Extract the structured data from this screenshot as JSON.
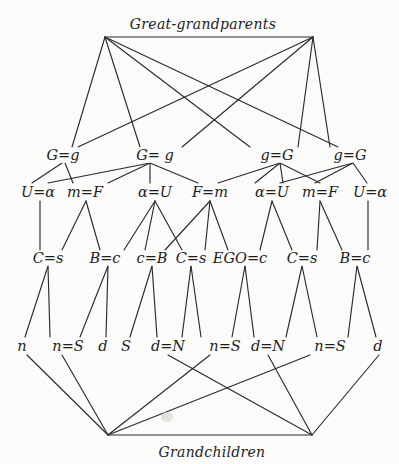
{
  "diagram": {
    "title_top": "Great-grandparents",
    "title_bottom": "Grandchildren",
    "colors": {
      "background": "#fbfbf9",
      "ink": "#2b2b2b"
    },
    "apexes": {
      "top_left": [
        105,
        37
      ],
      "top_right": [
        313,
        37
      ],
      "bottom_left": [
        108,
        435
      ],
      "bottom_right": [
        312,
        435
      ]
    },
    "rows": {
      "grandparents": [
        {
          "id": "gp1",
          "label": "G=g",
          "x": 63,
          "y": 155
        },
        {
          "id": "gp2",
          "label": "G= g",
          "x": 155,
          "y": 155
        },
        {
          "id": "gp3",
          "label": "g=G",
          "x": 277,
          "y": 155
        },
        {
          "id": "gp4",
          "label": "g=G",
          "x": 350,
          "y": 155
        }
      ],
      "parents": [
        {
          "id": "p1",
          "label": "U=α",
          "x": 38,
          "y": 192
        },
        {
          "id": "p2",
          "label": "m=F",
          "x": 85,
          "y": 192
        },
        {
          "id": "p3",
          "label": "α=U",
          "x": 155,
          "y": 192
        },
        {
          "id": "p4",
          "label": "F=m",
          "x": 210,
          "y": 192
        },
        {
          "id": "p5",
          "label": "α=U",
          "x": 272,
          "y": 192
        },
        {
          "id": "p6",
          "label": "m=F",
          "x": 320,
          "y": 192
        },
        {
          "id": "p7",
          "label": "U=α",
          "x": 370,
          "y": 192
        }
      ],
      "ego_generation": [
        {
          "id": "e1",
          "label": "C=s",
          "x": 48,
          "y": 258
        },
        {
          "id": "e2",
          "label": "B=c",
          "x": 105,
          "y": 258
        },
        {
          "id": "e3",
          "label": "c=B",
          "x": 152,
          "y": 258
        },
        {
          "id": "e4",
          "label": "C=s",
          "x": 191,
          "y": 258
        },
        {
          "id": "e5",
          "label": "EGO=c",
          "x": 240,
          "y": 258
        },
        {
          "id": "e6",
          "label": "C=s",
          "x": 302,
          "y": 258
        },
        {
          "id": "e7",
          "label": "B=c",
          "x": 355,
          "y": 258
        }
      ],
      "children": [
        {
          "id": "c1",
          "label": "n",
          "x": 22,
          "y": 346
        },
        {
          "id": "c2",
          "label": "n=S",
          "x": 68,
          "y": 346
        },
        {
          "id": "c3",
          "label": "d",
          "x": 103,
          "y": 346
        },
        {
          "id": "c4",
          "label": "S",
          "x": 126,
          "y": 346
        },
        {
          "id": "c5",
          "label": "d=N",
          "x": 168,
          "y": 346
        },
        {
          "id": "c6",
          "label": "n=S",
          "x": 225,
          "y": 346
        },
        {
          "id": "c7",
          "label": "d=N",
          "x": 268,
          "y": 346
        },
        {
          "id": "c8",
          "label": "n=S",
          "x": 330,
          "y": 346
        },
        {
          "id": "c9",
          "label": "d",
          "x": 378,
          "y": 346
        }
      ]
    },
    "edges": [
      [
        105,
        37,
        313,
        37
      ],
      [
        105,
        37,
        72,
        147
      ],
      [
        105,
        37,
        140,
        147
      ],
      [
        105,
        37,
        250,
        147
      ],
      [
        105,
        37,
        338,
        147
      ],
      [
        313,
        37,
        78,
        147
      ],
      [
        313,
        37,
        182,
        147
      ],
      [
        313,
        37,
        298,
        147
      ],
      [
        313,
        37,
        330,
        147
      ],
      [
        62,
        163,
        32,
        183
      ],
      [
        65,
        163,
        73,
        183
      ],
      [
        150,
        163,
        48,
        183
      ],
      [
        150,
        163,
        108,
        183
      ],
      [
        150,
        163,
        150,
        183
      ],
      [
        150,
        163,
        198,
        183
      ],
      [
        280,
        163,
        218,
        183
      ],
      [
        280,
        163,
        255,
        183
      ],
      [
        280,
        163,
        283,
        183
      ],
      [
        280,
        163,
        320,
        183
      ],
      [
        353,
        163,
        280,
        183
      ],
      [
        353,
        163,
        315,
        183
      ],
      [
        353,
        163,
        367,
        183
      ],
      [
        40,
        201,
        40,
        250
      ],
      [
        86,
        201,
        62,
        250
      ],
      [
        86,
        201,
        100,
        250
      ],
      [
        155,
        201,
        124,
        250
      ],
      [
        155,
        201,
        145,
        250
      ],
      [
        155,
        201,
        182,
        250
      ],
      [
        210,
        201,
        165,
        250
      ],
      [
        210,
        201,
        205,
        250
      ],
      [
        210,
        201,
        228,
        250
      ],
      [
        272,
        201,
        260,
        250
      ],
      [
        272,
        201,
        292,
        250
      ],
      [
        320,
        201,
        317,
        250
      ],
      [
        320,
        201,
        342,
        250
      ],
      [
        368,
        201,
        368,
        250
      ],
      [
        48,
        266,
        25,
        337
      ],
      [
        48,
        266,
        50,
        337
      ],
      [
        108,
        266,
        80,
        337
      ],
      [
        108,
        266,
        106,
        337
      ],
      [
        152,
        266,
        130,
        337
      ],
      [
        152,
        266,
        157,
        337
      ],
      [
        191,
        266,
        182,
        337
      ],
      [
        191,
        266,
        201,
        337
      ],
      [
        245,
        266,
        232,
        337
      ],
      [
        245,
        266,
        254,
        337
      ],
      [
        302,
        266,
        286,
        337
      ],
      [
        302,
        266,
        317,
        337
      ],
      [
        357,
        266,
        348,
        337
      ],
      [
        357,
        266,
        376,
        337
      ],
      [
        27,
        355,
        108,
        435
      ],
      [
        62,
        355,
        108,
        435
      ],
      [
        210,
        355,
        108,
        435
      ],
      [
        310,
        355,
        108,
        435
      ],
      [
        168,
        355,
        312,
        435
      ],
      [
        268,
        355,
        312,
        435
      ],
      [
        379,
        355,
        312,
        435
      ],
      [
        108,
        435,
        312,
        435
      ]
    ]
  }
}
